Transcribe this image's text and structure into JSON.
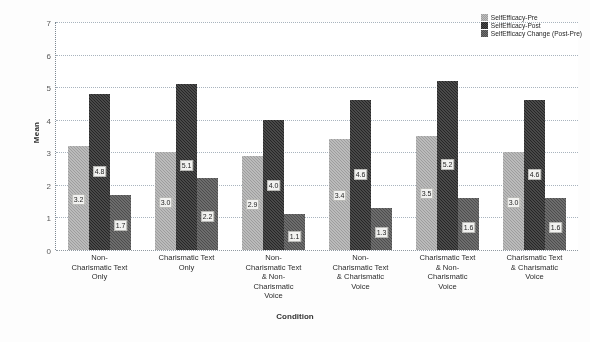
{
  "chart_data": {
    "type": "bar",
    "title": "",
    "xlabel": "Condition",
    "ylabel": "Mean",
    "ylim": [
      0,
      7
    ],
    "yticks": [
      0,
      1,
      2,
      3,
      4,
      5,
      6,
      7
    ],
    "grid": true,
    "legend_position": "top-right",
    "categories": [
      "Non-\nCharismatic Text\nOnly",
      "Charismatic Text\nOnly",
      "Non-\nCharismatic Text\n& Non-\nCharismatic\nVoice",
      "Non-\nCharismatic Text\n& Charismatic\nVoice",
      "Charismatic Text\n& Non-\nCharismatic\nVoice",
      "Charismatic Text\n& Charismatic\nVoice"
    ],
    "series": [
      {
        "name": "SelfEfficacy-Pre",
        "color": "#9d9d9d",
        "values": [
          3.2,
          3.0,
          2.9,
          3.4,
          3.5,
          3.0
        ],
        "labels": [
          "3.2",
          "3.0",
          "2.9",
          "3.4",
          "3.5",
          "3.0"
        ]
      },
      {
        "name": "SelfEfficacy-Post",
        "color": "#262626",
        "values": [
          4.8,
          5.1,
          4.0,
          4.6,
          5.2,
          4.6
        ],
        "labels": [
          "4.8",
          "5.1",
          "4.0",
          "4.6",
          "5.2",
          "4.6"
        ]
      },
      {
        "name": "SelfEfficacy Change (Post-Pre)",
        "color": "#4d4d4d",
        "values": [
          1.7,
          2.2,
          1.1,
          1.3,
          1.6,
          1.6
        ],
        "labels": [
          "1.7",
          "2.2",
          "1.1",
          "1.3",
          "1.6",
          "1.6"
        ]
      }
    ]
  }
}
